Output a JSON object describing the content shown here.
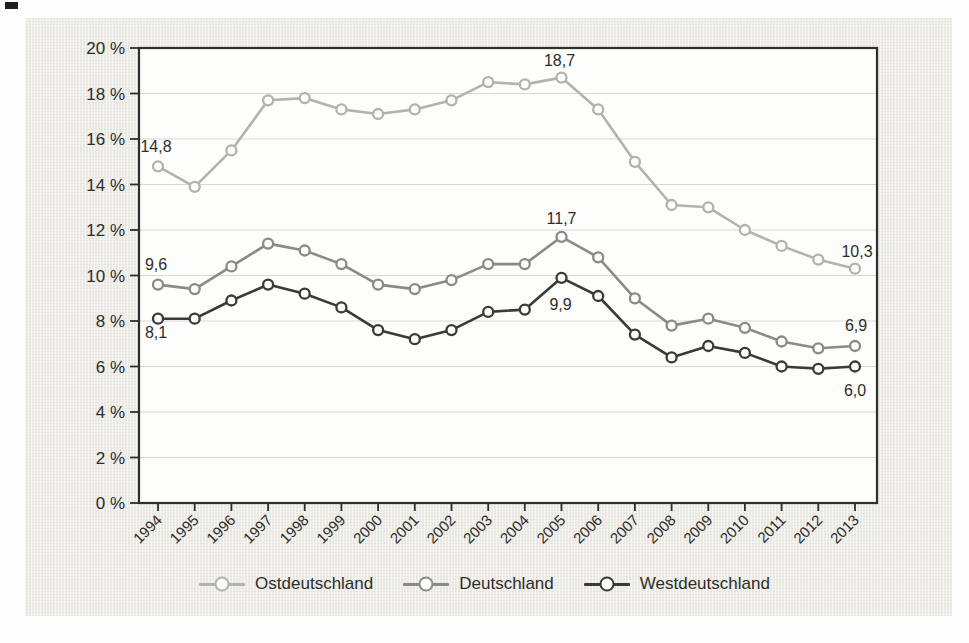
{
  "figure": {
    "page_background": "#fefefe",
    "panel_background": "#ecebe6",
    "plot_background": "#fdfdfb",
    "frame_color": "#2f2e2c",
    "grid_color": "#d9d7d2",
    "text_color": "#2e2d2b"
  },
  "chart_data": {
    "type": "line",
    "title": "",
    "xlabel": "",
    "ylabel": "",
    "x": [
      1994,
      1995,
      1996,
      1997,
      1998,
      1999,
      2000,
      2001,
      2002,
      2003,
      2004,
      2005,
      2006,
      2007,
      2008,
      2009,
      2010,
      2011,
      2012,
      2013
    ],
    "series": [
      {
        "name": "Ostdeutschland",
        "color": "#b3b2b0",
        "values": [
          14.8,
          13.9,
          15.5,
          17.7,
          17.8,
          17.3,
          17.1,
          17.3,
          17.7,
          18.5,
          18.4,
          18.7,
          17.3,
          15.0,
          13.1,
          13.0,
          12.0,
          11.3,
          10.7,
          10.3
        ]
      },
      {
        "name": "Deutschland",
        "color": "#8b8a88",
        "values": [
          9.6,
          9.4,
          10.4,
          11.4,
          11.1,
          10.5,
          9.6,
          9.4,
          9.8,
          10.5,
          10.5,
          11.7,
          10.8,
          9.0,
          7.8,
          8.1,
          7.7,
          7.1,
          6.8,
          6.9
        ]
      },
      {
        "name": "Westdeutschland",
        "color": "#3b3a38",
        "values": [
          8.1,
          8.1,
          8.9,
          9.6,
          9.2,
          8.6,
          7.6,
          7.2,
          7.6,
          8.4,
          8.5,
          9.9,
          9.1,
          7.4,
          6.4,
          6.9,
          6.6,
          6.0,
          5.9,
          6.0
        ]
      }
    ],
    "ylim": [
      0,
      20
    ],
    "ytick_step": 2,
    "ytick_labels": [
      "0 %",
      "2 %",
      "4 %",
      "6 %",
      "8 %",
      "10 %",
      "12 %",
      "14 %",
      "16 %",
      "18 %",
      "20 %"
    ],
    "grid": "horizontal",
    "legend_position": "bottom",
    "marker": "open-circle",
    "annotations": [
      {
        "series": 0,
        "year": 1994,
        "text": "14,8",
        "dx": -2,
        "dy": -14
      },
      {
        "series": 0,
        "year": 2005,
        "text": "18,7",
        "dx": -2,
        "dy": -12
      },
      {
        "series": 0,
        "year": 2013,
        "text": "10,3",
        "dx": 2,
        "dy": -12
      },
      {
        "series": 1,
        "year": 1994,
        "text": "9,6",
        "dx": -2,
        "dy": -15
      },
      {
        "series": 1,
        "year": 2005,
        "text": "11,7",
        "dx": 0,
        "dy": -13
      },
      {
        "series": 1,
        "year": 2013,
        "text": "6,9",
        "dx": 1,
        "dy": -15
      },
      {
        "series": 2,
        "year": 1994,
        "text": "8,1",
        "dx": -2,
        "dy": 19
      },
      {
        "series": 2,
        "year": 2005,
        "text": "9,9",
        "dx": -1,
        "dy": 32
      },
      {
        "series": 2,
        "year": 2013,
        "text": "6,0",
        "dx": 0,
        "dy": 29
      }
    ]
  }
}
